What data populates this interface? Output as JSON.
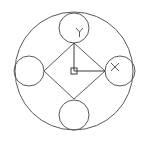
{
  "drawing": {
    "background": "#ffffff",
    "line_color": "#5a5a5a",
    "outer_circle": {
      "cx": 74,
      "cy": 71,
      "r": 59
    },
    "small_circles": [
      {
        "name": "top",
        "cx": 74,
        "cy": 28,
        "r": 15
      },
      {
        "name": "right",
        "cx": 120,
        "cy": 71,
        "r": 15
      },
      {
        "name": "bottom",
        "cx": 74,
        "cy": 115,
        "r": 15
      },
      {
        "name": "left",
        "cx": 29,
        "cy": 71,
        "r": 15
      }
    ],
    "diamond": {
      "points": "74,43 105,71 74,99 44,71"
    }
  },
  "ucs_icon": {
    "origin": {
      "x": 74,
      "y": 71
    },
    "x_axis_label": "X",
    "y_axis_label": "Y",
    "x_axis_end": {
      "x": 105,
      "y": 71
    },
    "y_axis_end": {
      "x": 74,
      "y": 43
    }
  }
}
